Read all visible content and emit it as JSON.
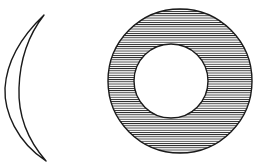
{
  "figure": {
    "title": "",
    "background_color": "#ffffff",
    "stroke_color": "#1a1a1a",
    "width": 254,
    "height": 166,
    "shapes": [
      {
        "name": "crescent-sliver",
        "type": "crescent",
        "description": "thin curved sickle / lens sliver, open to the left, pointed at both tips",
        "tip_top": {
          "x": 44,
          "y": 15
        },
        "tip_bottom": {
          "x": 46,
          "y": 161
        },
        "outer_arc_control": {
          "x": 5,
          "y": 88
        },
        "inner_arc_control": {
          "x": 16,
          "y": 88
        },
        "stroke_width": 1.4,
        "fill": "none"
      },
      {
        "name": "hatched-annulus",
        "type": "annulus",
        "description": "circular ring with horizontal line hatching between outer and inner circle",
        "center": {
          "x": 180,
          "y": 81
        },
        "outer_radius": 72,
        "inner_center": {
          "x": 171,
          "y": 81
        },
        "inner_radius": 37,
        "stroke_width": 1.4,
        "hatch": {
          "orientation": "horizontal",
          "spacing_px": 2.2,
          "line_width": 0.85,
          "color": "#1a1a1a"
        }
      }
    ]
  }
}
